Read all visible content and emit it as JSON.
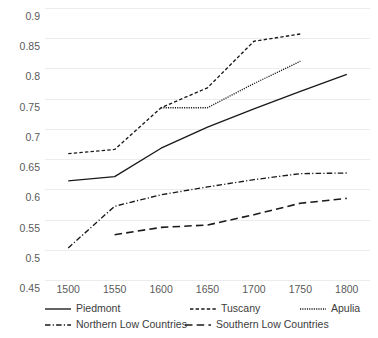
{
  "chart_data": {
    "type": "line",
    "title": "",
    "xlabel": "",
    "ylabel": "",
    "x": [
      1500,
      1550,
      1600,
      1650,
      1700,
      1750,
      1800
    ],
    "xlim": [
      1475,
      1825
    ],
    "ylim": [
      0.45,
      0.9
    ],
    "yticks": [
      0.45,
      0.5,
      0.55,
      0.6,
      0.65,
      0.7,
      0.75,
      0.8,
      0.85,
      0.9
    ],
    "ytick_labels": [
      "0.45",
      "0.5",
      "0.55",
      "0.6",
      "0.65",
      "0.7",
      "0.75",
      "0.8",
      "0.85",
      "0.9"
    ],
    "xtick_labels": [
      "1500",
      "1550",
      "1600",
      "1650",
      "1700",
      "1750",
      "1800"
    ],
    "grid": "horizontal",
    "legend_position": "bottom",
    "series": [
      {
        "name": "Piedmont",
        "style": "solid",
        "x": [
          1500,
          1550,
          1600,
          1650,
          1700,
          1750,
          1800
        ],
        "values": [
          0.614,
          0.621,
          0.668,
          0.703,
          0.733,
          0.762,
          0.79
        ]
      },
      {
        "name": "Tuscany",
        "style": "dashed",
        "x": [
          1500,
          1550,
          1600,
          1650,
          1700,
          1750
        ],
        "values": [
          0.659,
          0.666,
          0.735,
          0.768,
          0.845,
          0.857
        ]
      },
      {
        "name": "Apulia",
        "style": "dotted",
        "x": [
          1600,
          1650,
          1700,
          1750
        ],
        "values": [
          0.735,
          0.735,
          0.775,
          0.812
        ]
      },
      {
        "name": "Northern Low Countries",
        "style": "dashdot",
        "x": [
          1500,
          1550,
          1600,
          1650,
          1700,
          1750,
          1800
        ],
        "values": [
          0.503,
          0.572,
          0.591,
          0.604,
          0.616,
          0.626,
          0.627
        ]
      },
      {
        "name": "Southern Low Countries",
        "style": "longdash",
        "x": [
          1550,
          1600,
          1650,
          1700,
          1750,
          1800
        ],
        "values": [
          0.525,
          0.537,
          0.541,
          0.558,
          0.577,
          0.585
        ]
      }
    ],
    "colors": {
      "line": "#1a1a1a",
      "grid": "#ececed",
      "tick_text": "#5a5a5a",
      "background": "#ffffff"
    }
  }
}
